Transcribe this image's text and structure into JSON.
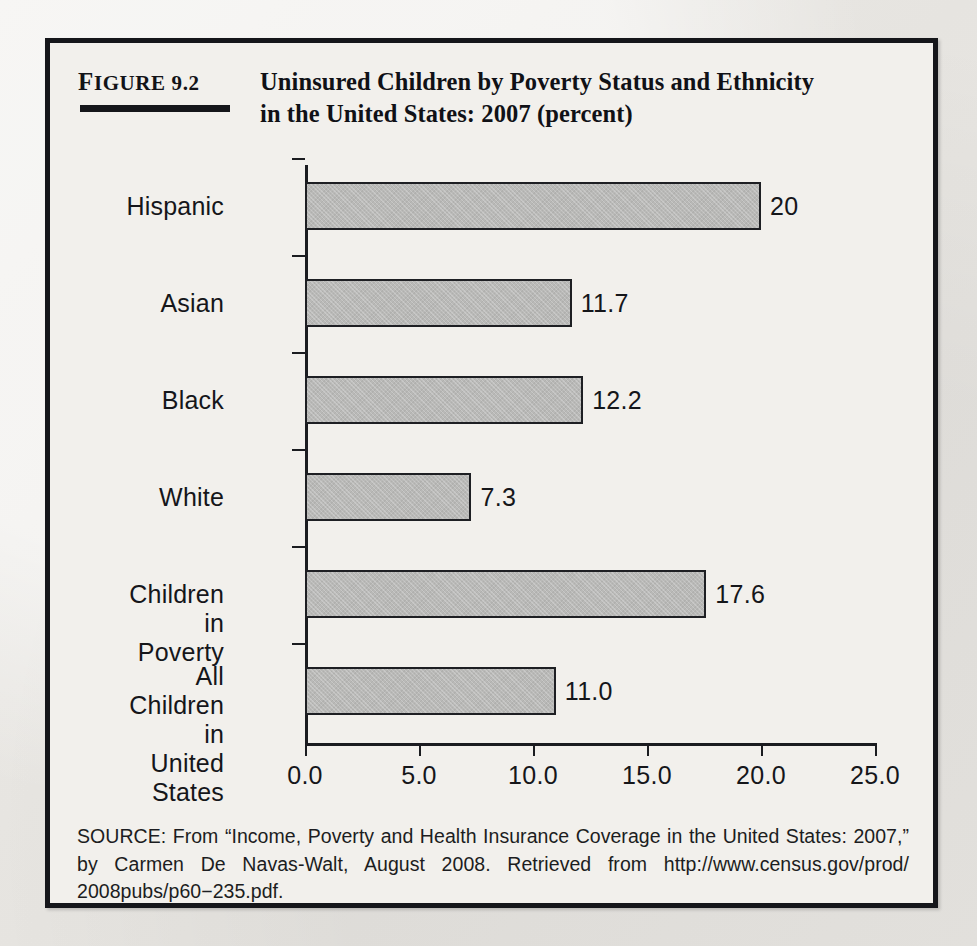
{
  "figure": {
    "number_prefix": "F",
    "number_rest": "IGURE",
    "number_value": "9.2",
    "title_line1": "Uninsured Children by Poverty Status and Ethnicity",
    "title_line2": "in the United States: 2007 (percent)"
  },
  "chart_data": {
    "type": "bar",
    "orientation": "horizontal",
    "title": "Uninsured Children by Poverty Status and Ethnicity in the United States: 2007 (percent)",
    "categories": [
      "Hispanic",
      "Asian",
      "Black",
      "White",
      "Children in Poverty",
      "All Children in\nUnited States"
    ],
    "values": [
      20,
      11.7,
      12.2,
      7.3,
      17.6,
      11.0
    ],
    "value_labels": [
      "20",
      "11.7",
      "12.2",
      "7.3",
      "17.6",
      "11.0"
    ],
    "xlabel": "",
    "ylabel": "",
    "xlim": [
      0,
      25
    ],
    "xticks": [
      0,
      5,
      10,
      15,
      20,
      25
    ],
    "xtick_labels": [
      "0.0",
      "5.0",
      "10.0",
      "15.0",
      "20.0",
      "25.0"
    ],
    "grid": false,
    "legend": false,
    "bar_color": "#b9b9b7",
    "bar_edge_color": "#1e1f23",
    "axis_color": "#1b1c20"
  },
  "source": {
    "line1": "SOURCE: From “Income, Poverty and Health Insurance Coverage in the United States: 2007,”",
    "line2": "by Carmen De Navas-Walt, August 2008. Retrieved from http://www.census.gov/prod/",
    "line3": "2008pubs/p60−235.pdf."
  }
}
